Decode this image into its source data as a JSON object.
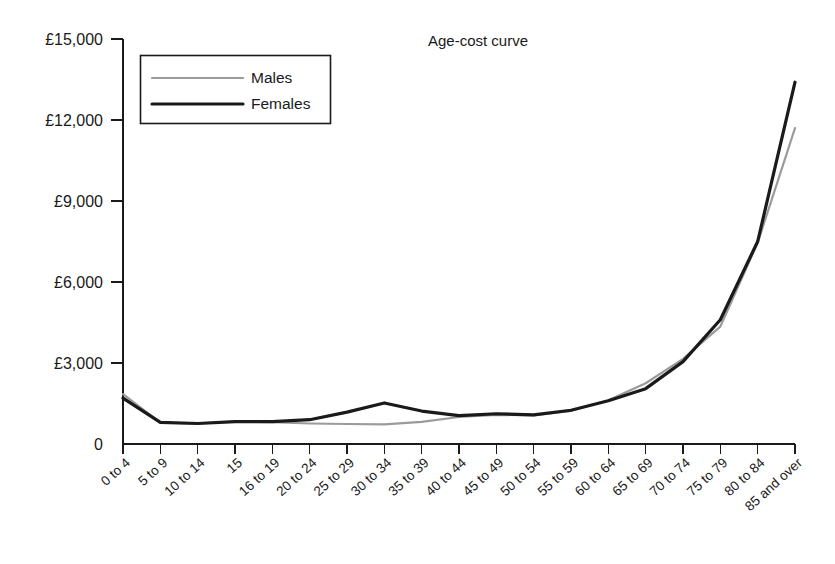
{
  "chart_data": {
    "type": "line",
    "title": "Age-cost curve",
    "xlabel": "",
    "ylabel": "",
    "grid": false,
    "legend_position": "top-left-inside",
    "ylim": [
      0,
      15000
    ],
    "y_ticks": [
      0,
      3000,
      6000,
      9000,
      12000,
      15000
    ],
    "y_tick_labels": [
      "0",
      "£3,000",
      "£6,000",
      "£9,000",
      "£12,000",
      "£15,000"
    ],
    "categories": [
      "0 to 4",
      "5 to 9",
      "10 to 14",
      "15",
      "16 to 19",
      "20 to 24",
      "25 to 29",
      "30 to 34",
      "35 to 39",
      "40 to 44",
      "45 to 49",
      "50 to 54",
      "55 to 59",
      "60 to 64",
      "65 to 69",
      "70 to 74",
      "75 to 79",
      "80 to 84",
      "85 and over"
    ],
    "series": [
      {
        "name": "Males",
        "color": "#9b9b9b",
        "width": 2.2,
        "values": [
          1850,
          790,
          760,
          830,
          810,
          760,
          740,
          730,
          820,
          1000,
          1080,
          1060,
          1230,
          1620,
          2250,
          3150,
          4350,
          7450,
          11700
        ]
      },
      {
        "name": "Females",
        "color": "#1a1a1a",
        "width": 3.2,
        "values": [
          1700,
          800,
          760,
          830,
          830,
          900,
          1180,
          1520,
          1220,
          1050,
          1120,
          1080,
          1250,
          1600,
          2050,
          3050,
          4600,
          7500,
          13400
        ]
      }
    ]
  },
  "legend": {
    "items": [
      {
        "label": "Males"
      },
      {
        "label": "Females"
      }
    ]
  },
  "axes": {
    "y_axis_name": "cost-axis",
    "x_axis_name": "age-band-axis"
  }
}
